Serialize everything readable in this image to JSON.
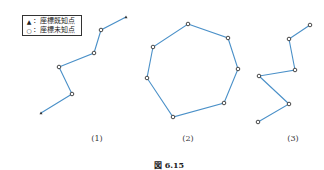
{
  "legend": {
    "known": {
      "symbol": "▲",
      "label": "：座標既知点"
    },
    "unknown": {
      "symbol": "○",
      "label": "：座標未知点"
    }
  },
  "line_color": "#4a90c8",
  "point_color": "#333333",
  "figures": [
    {
      "label": "(1)",
      "type": "open-traverse",
      "points": [
        {
          "x": 126,
          "y": 17,
          "kind": "known"
        },
        {
          "x": 101,
          "y": 30,
          "kind": "unknown"
        },
        {
          "x": 94,
          "y": 53,
          "kind": "unknown"
        },
        {
          "x": 59,
          "y": 67,
          "kind": "unknown"
        },
        {
          "x": 72,
          "y": 94,
          "kind": "unknown"
        },
        {
          "x": 41,
          "y": 113,
          "kind": "known"
        }
      ]
    },
    {
      "label": "(2)",
      "type": "closed-traverse",
      "points": [
        {
          "x": 188,
          "y": 24,
          "kind": "unknown"
        },
        {
          "x": 228,
          "y": 38,
          "kind": "unknown"
        },
        {
          "x": 238,
          "y": 69,
          "kind": "unknown"
        },
        {
          "x": 224,
          "y": 103,
          "kind": "unknown"
        },
        {
          "x": 173,
          "y": 117,
          "kind": "unknown"
        },
        {
          "x": 147,
          "y": 78,
          "kind": "unknown"
        },
        {
          "x": 153,
          "y": 47,
          "kind": "unknown"
        }
      ]
    },
    {
      "label": "(3)",
      "type": "open-traverse",
      "points": [
        {
          "x": 310,
          "y": 25,
          "kind": "unknown"
        },
        {
          "x": 289,
          "y": 39,
          "kind": "unknown"
        },
        {
          "x": 295,
          "y": 70,
          "kind": "unknown"
        },
        {
          "x": 259,
          "y": 76,
          "kind": "unknown"
        },
        {
          "x": 289,
          "y": 104,
          "kind": "unknown"
        },
        {
          "x": 258,
          "y": 122,
          "kind": "unknown"
        }
      ]
    }
  ],
  "labels": {
    "fig1": "(1)",
    "fig2": "(2)",
    "fig3": "(3)"
  },
  "caption": "図 6.15"
}
